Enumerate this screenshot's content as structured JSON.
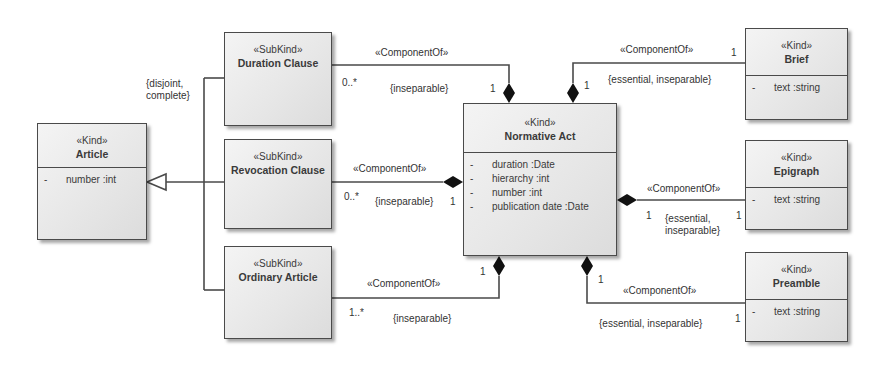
{
  "classes": {
    "article": {
      "stereotype": "«Kind»",
      "name": "Article",
      "attrs": [
        {
          "vis": "-",
          "text": "number  :int"
        }
      ]
    },
    "duration_clause": {
      "stereotype": "«SubKind»",
      "name": "Duration Clause"
    },
    "revocation_clause": {
      "stereotype": "«SubKind»",
      "name": "Revocation Clause"
    },
    "ordinary_article": {
      "stereotype": "«SubKind»",
      "name": "Ordinary Article"
    },
    "normative_act": {
      "stereotype": "«Kind»",
      "name": "Normative Act",
      "attrs": [
        {
          "vis": "-",
          "text": "duration  :Date"
        },
        {
          "vis": "-",
          "text": "hierarchy  :int"
        },
        {
          "vis": "-",
          "text": "number  :int"
        },
        {
          "vis": "-",
          "text": "publication date  :Date"
        }
      ]
    },
    "brief": {
      "stereotype": "«Kind»",
      "name": "Brief",
      "attrs": [
        {
          "vis": "-",
          "text": "text  :string"
        }
      ]
    },
    "epigraph": {
      "stereotype": "«Kind»",
      "name": "Epigraph",
      "attrs": [
        {
          "vis": "-",
          "text": "text  :string"
        }
      ]
    },
    "preamble": {
      "stereotype": "«Kind»",
      "name": "Preamble",
      "attrs": [
        {
          "vis": "-",
          "text": "text  :string"
        }
      ]
    }
  },
  "generalization": {
    "constraint_line1": "{disjoint,",
    "constraint_line2": "complete}"
  },
  "associations": {
    "duration": {
      "stereotype": "«ComponentOf»",
      "constraint": "{inseparable}",
      "part_mult": "0..*",
      "whole_mult": "1"
    },
    "revocation": {
      "stereotype": "«ComponentOf»",
      "constraint": "{inseparable}",
      "part_mult": "0..*",
      "whole_mult": "1"
    },
    "ordinary": {
      "stereotype": "«ComponentOf»",
      "constraint": "{inseparable}",
      "part_mult": "1..*",
      "whole_mult": "1"
    },
    "brief": {
      "stereotype": "«ComponentOf»",
      "constraint": "{essential, inseparable}",
      "part_mult": "1",
      "whole_mult": "1"
    },
    "epigraph": {
      "stereotype": "«ComponentOf»",
      "constraint_line1": "{essential,",
      "constraint_line2": "inseparable}",
      "part_mult": "1",
      "whole_mult": "1"
    },
    "preamble": {
      "stereotype": "«ComponentOf»",
      "constraint": "{essential, inseparable}",
      "part_mult": "1",
      "whole_mult": "1"
    }
  },
  "colors": {
    "line": "#4a4a4a",
    "box_fill": "#e8e8e8",
    "text": "#333333"
  }
}
